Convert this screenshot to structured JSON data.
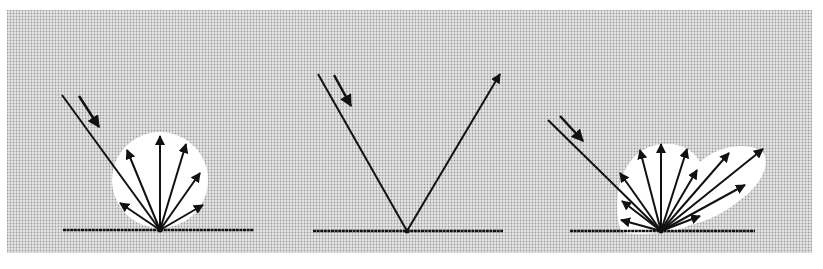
{
  "figure": {
    "colors": {
      "background": "#ffffff",
      "panel_fill": "#cfcfcf",
      "lobe_fill": "#ffffff",
      "stroke": "#111111"
    },
    "panels": [
      {
        "id": "diffuse",
        "surface": {
          "x1": 63,
          "x2": 254,
          "y": 230
        },
        "origin": [
          160,
          230
        ],
        "incident": {
          "from": [
            62,
            95
          ]
        },
        "direction_arrow": {
          "from": [
            79,
            96
          ],
          "to": [
            99,
            127
          ]
        },
        "lobe": {
          "type": "circle",
          "cx": 160,
          "cy": 180,
          "r": 48
        },
        "rays": [
          [
            120,
            203
          ],
          [
            127,
            150
          ],
          [
            160,
            136
          ],
          [
            186,
            144
          ],
          [
            200,
            173
          ],
          [
            203,
            205
          ]
        ]
      },
      {
        "id": "specular",
        "surface": {
          "x1": 313,
          "x2": 503,
          "y": 231
        },
        "origin": [
          407,
          231
        ],
        "incident": {
          "from": [
            318,
            74
          ]
        },
        "direction_arrow": {
          "from": [
            334,
            75
          ],
          "to": [
            351,
            106
          ]
        },
        "rays": [
          [
            500,
            74
          ]
        ]
      },
      {
        "id": "mixed",
        "surface": {
          "x1": 570,
          "x2": 755,
          "y": 231
        },
        "origin": [
          661,
          231
        ],
        "incident": {
          "from": [
            548,
            120
          ]
        },
        "direction_arrow": {
          "from": [
            560,
            116
          ],
          "to": [
            583,
            141
          ]
        },
        "lobe_path": "M 621 231 C 612 205 618 168 640 152 C 660 138 690 142 700 162 C 712 150 740 140 760 150 C 776 162 756 190 740 200 C 728 210 712 220 690 225 C 680 230 668 232 661 232 C 650 234 630 236 621 231 Z",
        "rays": [
          [
            621,
            220
          ],
          [
            622,
            201
          ],
          [
            620,
            173
          ],
          [
            640,
            150
          ],
          [
            661,
            144
          ],
          [
            687,
            149
          ],
          [
            697,
            170
          ],
          [
            729,
            153
          ],
          [
            763,
            149
          ],
          [
            745,
            185
          ],
          [
            700,
            216
          ]
        ]
      }
    ]
  }
}
